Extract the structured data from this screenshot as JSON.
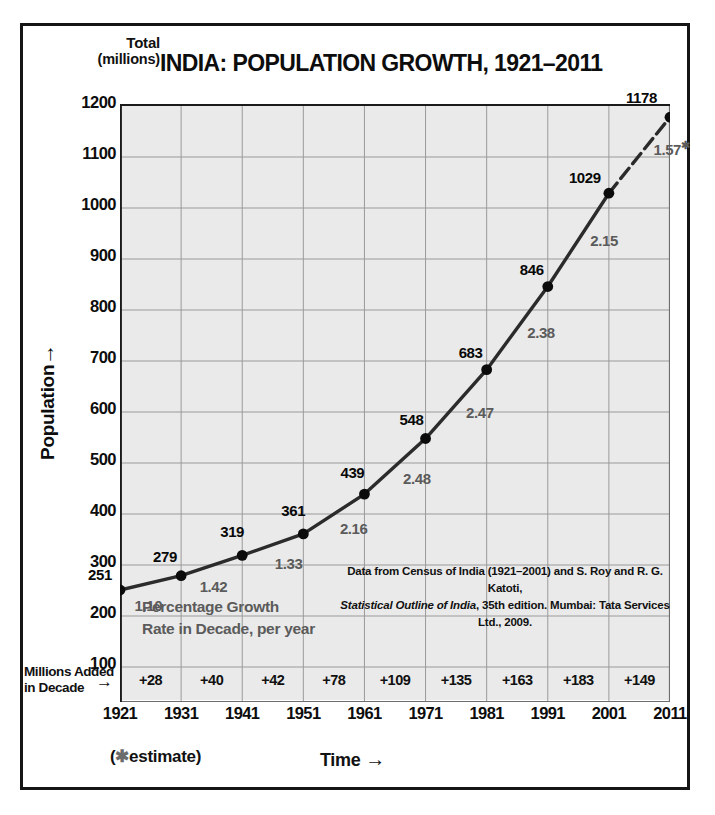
{
  "figure": {
    "title": "INDIA: POPULATION GROWTH, 1921–2011",
    "total_head_line1": "Total",
    "total_head_line2": "(millions)",
    "y_axis_title": "Population",
    "y_axis_arrow": "→",
    "x_axis_title": "Time",
    "x_axis_arrow": "→",
    "estimate_note_open": "(",
    "estimate_note_star": "✱",
    "estimate_note_text": "estimate)",
    "added_caption_line1": "Millions Added",
    "added_caption_line2": "in Decade",
    "added_arrow": "→",
    "in_plot_note_line1": "Percentage Growth",
    "in_plot_note_line2": "Rate in Decade, per year",
    "source_line1": "Data from Census of India (1921–2001) and S. Roy and R. G. Katoti,",
    "source_line2_italic": "Statistical Outline of India",
    "source_line2_rest": ", 35th edition. Mumbai: Tata Services Ltd., 2009.",
    "colors": {
      "plot_background": "#eaeaea",
      "grid": "#9a9a9a",
      "line": "#2b2b2b",
      "marker": "#0b0b0b",
      "rate_label": "#5b5b5b",
      "frame": "#151515",
      "text": "#111111"
    }
  },
  "chart_data": {
    "type": "line",
    "title": "INDIA: POPULATION GROWTH, 1921–2011",
    "xlabel": "Time",
    "ylabel": "Population",
    "y_unit": "Total (millions)",
    "grid": true,
    "legend": "none",
    "xlim": [
      1921,
      2011
    ],
    "ylim": [
      0,
      1200
    ],
    "yticks": [
      1200,
      1100,
      1000,
      900,
      800,
      700,
      600,
      500,
      400,
      300,
      200,
      100
    ],
    "xticks": [
      1921,
      1931,
      1941,
      1951,
      1961,
      1971,
      1981,
      1991,
      2001,
      2011
    ],
    "x": [
      1921,
      1931,
      1941,
      1951,
      1961,
      1971,
      1981,
      1991,
      2001,
      2011
    ],
    "values": [
      251,
      279,
      319,
      361,
      439,
      548,
      683,
      846,
      1029,
      1178
    ],
    "point_labels": [
      "251",
      "279",
      "319",
      "361",
      "439",
      "548",
      "683",
      "846",
      "1029",
      "1178"
    ],
    "decade_growth_rate_percent_per_year": {
      "label": "Percentage Growth Rate in Decade, per year",
      "intervals": [
        "1921–1931",
        "1931–1941",
        "1941–1951",
        "1951–1961",
        "1961–1971",
        "1971–1981",
        "1981–1991",
        "1991–2001",
        "2001–2011"
      ],
      "values": [
        "1.10",
        "1.42",
        "1.33",
        "2.16",
        "2.48",
        "2.47",
        "2.38",
        "2.15",
        "1.57"
      ],
      "estimated_flags": [
        false,
        false,
        false,
        false,
        false,
        false,
        false,
        false,
        true
      ]
    },
    "millions_added_in_decade": {
      "label": "Millions Added in Decade",
      "intervals": [
        "1921–1931",
        "1931–1941",
        "1941–1951",
        "1951–1961",
        "1961–1971",
        "1971–1981",
        "1981–1991",
        "1991–2001",
        "2001–2011"
      ],
      "values": [
        "+28",
        "+40",
        "+42",
        "+78",
        "+109",
        "+135",
        "+163",
        "+183",
        "+149"
      ]
    },
    "final_segment_dashed": true,
    "annotations": [
      "Data from Census of India (1921–2001) and S. Roy and R. G. Katoti, Statistical Outline of India, 35th edition. Mumbai: Tata Services Ltd., 2009.",
      "(✱estimate)"
    ]
  }
}
